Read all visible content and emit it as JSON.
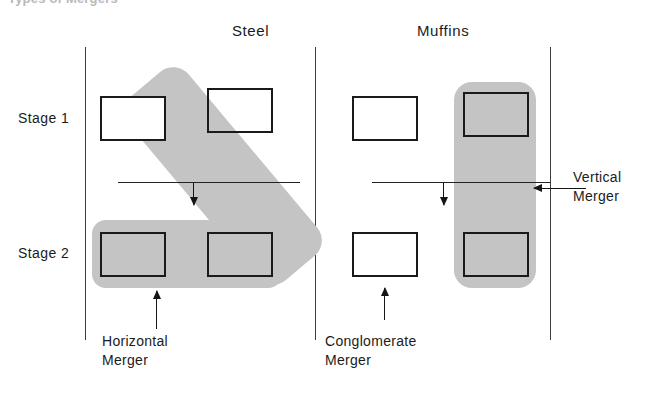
{
  "figure": {
    "cropped_caption": "Types of Mergers",
    "columns": [
      {
        "label": "Steel"
      },
      {
        "label": "Muffins"
      }
    ],
    "rows": [
      {
        "label": "Stage 1"
      },
      {
        "label": "Stage 2"
      }
    ],
    "annotations": [
      {
        "line1": "Horizontal",
        "line2": "Merger"
      },
      {
        "line1": "Conglomerate",
        "line2": "Merger"
      },
      {
        "line1": "Vertical",
        "line2": "Merger"
      }
    ],
    "colors": {
      "blob_gray": "#c4c4c4",
      "box_outline": "#1a1a1a",
      "rule": "#3d3d3d",
      "text": "#1b1b1b"
    },
    "boxes": [
      {
        "id": "steel-stage1-left",
        "shaded": "no"
      },
      {
        "id": "steel-stage1-right",
        "shaded": "yes"
      },
      {
        "id": "muffins-stage1-left",
        "shaded": "no"
      },
      {
        "id": "muffins-stage1-right",
        "shaded": "yes"
      },
      {
        "id": "steel-stage2-left",
        "shaded": "yes"
      },
      {
        "id": "steel-stage2-right",
        "shaded": "yes"
      },
      {
        "id": "muffins-stage2-left",
        "shaded": "yes"
      },
      {
        "id": "muffins-stage2-right",
        "shaded": "yes"
      }
    ]
  }
}
